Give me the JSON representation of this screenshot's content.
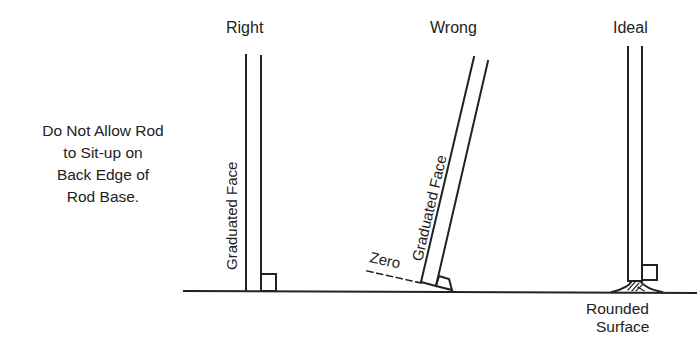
{
  "diagram": {
    "columns": [
      {
        "id": "right",
        "title": "Right",
        "face_label": "Graduated Face"
      },
      {
        "id": "wrong",
        "title": "Wrong",
        "face_label": "Graduated Face",
        "zero_label": "Zero"
      },
      {
        "id": "ideal",
        "title": "Ideal",
        "surface_label_line1": "Rounded",
        "surface_label_line2": "Surface"
      }
    ],
    "note": {
      "lines": [
        "Do Not Allow Rod",
        "to Sit-up on",
        "Back Edge of",
        "Rod Base."
      ]
    },
    "colors": {
      "ink": "#222222",
      "background": "#ffffff"
    }
  }
}
